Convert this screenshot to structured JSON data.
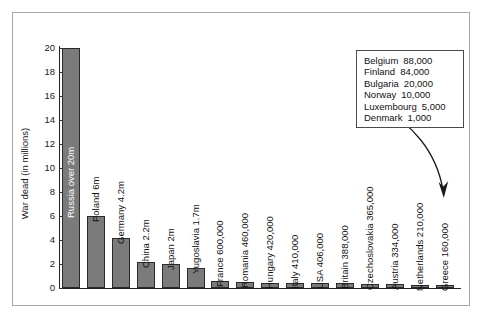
{
  "figure": {
    "name": "war-dead-by-country-bar-chart",
    "frame_border_color": "#a8a8a8",
    "bar_fill_color": "#7b7b7b",
    "bar_stroke_color": "#2b2b2b",
    "text_color": "#111111"
  },
  "chart_data": {
    "type": "bar",
    "title": "",
    "xlabel": "",
    "ylabel": "War dead (in millions)",
    "ylim": [
      0,
      20
    ],
    "ytick_step": 2,
    "grid": false,
    "legend": "none",
    "yticks": [
      "20",
      "18",
      "16",
      "14",
      "12",
      "10",
      "8",
      "6",
      "4",
      "2",
      "0"
    ],
    "categories": [
      "Russia",
      "Poland",
      "Germany",
      "China",
      "Japan",
      "Yugoslavia",
      "France",
      "Romania",
      "Hungary",
      "Italy",
      "USA",
      "Britain",
      "Czechoslovakia",
      "Austria",
      "Netherlands",
      "Greece"
    ],
    "values": [
      20,
      6,
      4.2,
      2.2,
      2,
      1.7,
      0.6,
      0.46,
      0.42,
      0.41,
      0.406,
      0.388,
      0.365,
      0.334,
      0.21,
      0.16
    ],
    "bar_labels": [
      "Russia over 20m",
      "Poland 6m",
      "Germany 4.2m",
      "China 2.2m",
      "Japan 2m",
      "Yugoslavia 1.7m",
      "France 600,000",
      "Romania 460,000",
      "Hungary 420,000",
      "Italy 410,000",
      "USA 406,000",
      "Britain 388,000",
      "Czechoslovakia 365,000",
      "Austria 334,000",
      "Netherlands 210,000",
      "Greece 160,000"
    ],
    "annotation_box": {
      "rows": [
        {
          "country": "Belgium",
          "value": "88,000"
        },
        {
          "country": "Finland",
          "value": "84,000"
        },
        {
          "country": "Bulgaria",
          "value": "20,000"
        },
        {
          "country": "Norway",
          "value": "10,000"
        },
        {
          "country": "Luxembourg",
          "value": "5,000"
        },
        {
          "country": "Denmark",
          "value": "1,000"
        }
      ],
      "arrow": "curved arrow pointing down to the smallest bars"
    }
  }
}
